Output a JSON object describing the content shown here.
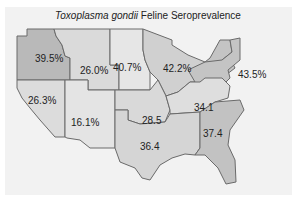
{
  "title": {
    "italic": "Toxoplasma gondii",
    "rest": " Feline Seroprevalence"
  },
  "colors": {
    "background": "#f2f2f2",
    "region_light": "#dcdcdc",
    "region_mid": "#c8c8c8",
    "region_dark": "#b4b4b4",
    "border": "#555555"
  },
  "regions": [
    {
      "name": "pacific-northwest",
      "label": "39.5%"
    },
    {
      "name": "mountain-north",
      "label": "26.0%"
    },
    {
      "name": "plains-north",
      "label": "40.7%"
    },
    {
      "name": "great-lakes",
      "label": "42.2%"
    },
    {
      "name": "northeast",
      "label": "43.5%"
    },
    {
      "name": "california-nevada",
      "label": "26.3%"
    },
    {
      "name": "southwest",
      "label": "16.1%"
    },
    {
      "name": "central",
      "label": "28.5"
    },
    {
      "name": "mid-atlantic",
      "label": "34.1"
    },
    {
      "name": "south-central",
      "label": "36.4"
    },
    {
      "name": "southeast",
      "label": "37.4"
    }
  ]
}
